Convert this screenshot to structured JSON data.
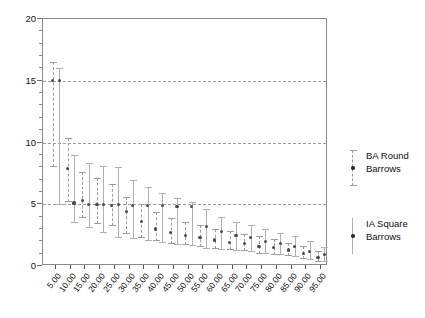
{
  "chart_data": {
    "type": "scatter",
    "title": "",
    "xlabel": "",
    "ylabel": "",
    "ylim": [
      0,
      20
    ],
    "yticks": [
      0,
      5,
      10,
      15,
      20
    ],
    "ytick_labels": [
      "0",
      "5",
      "10",
      "15",
      "20"
    ],
    "gridlines_y": [
      5,
      10,
      15
    ],
    "grid": true,
    "legend_position": "right",
    "categories": [
      "5.00",
      "10.00",
      "15.00",
      "20.00",
      "25.00",
      "30.00",
      "35.00",
      "40.00",
      "45.00",
      "50.00",
      "55.00",
      "60.00",
      "65.00",
      "70.00",
      "75.00",
      "80.00",
      "85.00",
      "90.00",
      "95.00"
    ],
    "series": [
      {
        "name": "BA Round Barrows",
        "style": "dashed-errorbar-with-caps",
        "values": [
          15.0,
          7.9,
          5.3,
          5.0,
          4.9,
          4.4,
          3.6,
          3.0,
          2.7,
          2.5,
          2.3,
          2.1,
          1.9,
          1.8,
          1.6,
          1.5,
          1.3,
          1.0,
          0.7
        ],
        "lower": [
          8.0,
          5.2,
          3.9,
          3.4,
          3.2,
          2.6,
          2.3,
          2.0,
          1.8,
          1.7,
          1.5,
          1.4,
          1.3,
          1.2,
          1.0,
          0.9,
          0.8,
          0.6,
          0.3
        ],
        "upper": [
          16.5,
          10.4,
          7.6,
          7.1,
          6.6,
          5.6,
          5.0,
          4.4,
          3.9,
          3.6,
          3.3,
          3.0,
          2.8,
          2.6,
          2.4,
          2.2,
          1.9,
          1.6,
          1.2
        ]
      },
      {
        "name": "IA Square Barrows",
        "style": "solid-errorbar",
        "values": [
          15.0,
          5.1,
          5.0,
          5.0,
          5.0,
          4.9,
          4.9,
          4.9,
          4.8,
          4.8,
          3.2,
          2.8,
          2.5,
          2.3,
          2.0,
          1.8,
          1.6,
          1.2,
          0.9
        ],
        "lower": [
          4.9,
          3.5,
          3.1,
          2.7,
          2.3,
          2.2,
          2.0,
          1.9,
          1.7,
          1.6,
          1.4,
          1.3,
          1.2,
          1.1,
          1.0,
          0.9,
          0.7,
          0.5,
          0.3
        ],
        "upper": [
          16.0,
          9.0,
          8.3,
          8.1,
          8.0,
          7.0,
          6.4,
          5.9,
          5.5,
          5.2,
          4.6,
          4.0,
          3.6,
          3.3,
          3.0,
          2.7,
          2.4,
          2.0,
          1.5
        ]
      }
    ]
  },
  "legend": {
    "items": [
      {
        "label_line1": "BA Round",
        "label_line2": "Barrows",
        "marker": "dashed-errorbar-marker"
      },
      {
        "label_line1": "IA Square",
        "label_line2": "Barrows",
        "marker": "solid-errorbar-marker"
      }
    ]
  },
  "colors": {
    "frame": "#8a8a8a",
    "grid": "#9a9a9a",
    "ba_series": "#9c9c9c",
    "ia_series": "#b0b0b0",
    "point": "#4a4a4a",
    "text": "#111111"
  }
}
